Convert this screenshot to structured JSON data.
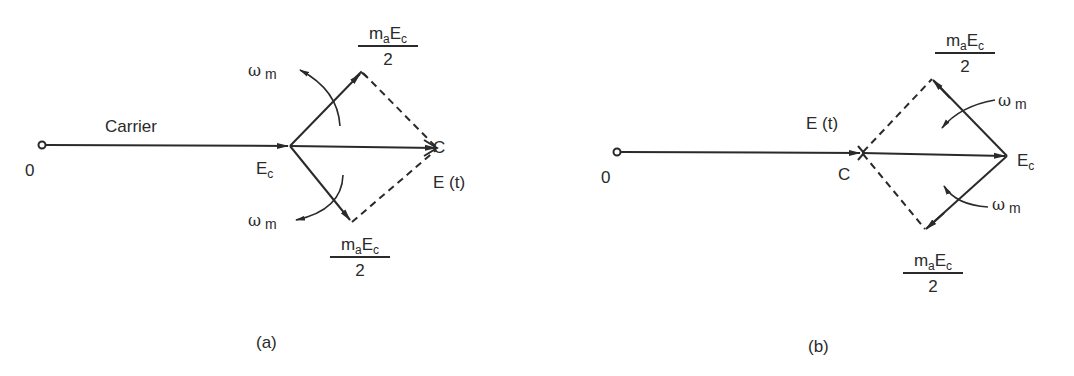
{
  "diagram": {
    "type": "phasor-diagram",
    "colors": {
      "ink": "#2a2a2a",
      "background": "#ffffff"
    },
    "panels": [
      {
        "id": "a",
        "caption": "(a)",
        "origin_label": "0",
        "carrier_label": "Carrier",
        "junction_label_main": "E",
        "junction_label_sub": "c",
        "tip_label": "C",
        "resultant_label": "E (t)",
        "upper_sideband": {
          "num_m": "m",
          "num_a": "a",
          "num_E": "E",
          "num_c": "c",
          "den": "2"
        },
        "lower_sideband": {
          "num_m": "m",
          "num_a": "a",
          "num_E": "E",
          "num_c": "c",
          "den": "2"
        },
        "omega_upper": {
          "symbol": "ω",
          "sub": "m"
        },
        "omega_lower": {
          "symbol": "ω",
          "sub": "m"
        }
      },
      {
        "id": "b",
        "caption": "(b)",
        "origin_label": "0",
        "junction_label": "C",
        "resultant_label": "E (t)",
        "tip_label_main": "E",
        "tip_label_sub": "c",
        "upper_sideband": {
          "num_m": "m",
          "num_a": "a",
          "num_E": "E",
          "num_c": "c",
          "den": "2"
        },
        "lower_sideband": {
          "num_m": "m",
          "num_a": "a",
          "num_E": "E",
          "num_c": "c",
          "den": "2"
        },
        "omega_upper": {
          "symbol": "ω",
          "sub": "m"
        },
        "omega_lower": {
          "symbol": "ω",
          "sub": "m"
        }
      }
    ]
  }
}
